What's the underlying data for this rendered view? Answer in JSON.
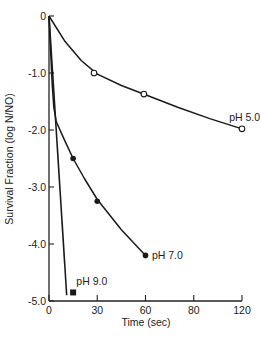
{
  "chart_data": {
    "type": "line",
    "title": "",
    "xlabel": "Time (sec)",
    "ylabel": "Survival Fraction (log N/NO)",
    "xlim": [
      0,
      120
    ],
    "ylim": [
      -5.0,
      0
    ],
    "grid": false,
    "x_ticks": [
      {
        "value": 0,
        "label": "0"
      },
      {
        "value": 30,
        "label": "30"
      },
      {
        "value": 60,
        "label": "60"
      },
      {
        "value": 90,
        "label": "80"
      },
      {
        "value": 120,
        "label": "120"
      }
    ],
    "y_ticks": [
      {
        "value": 0,
        "label": "0"
      },
      {
        "value": -1.0,
        "label": "-1.0"
      },
      {
        "value": -2.0,
        "label": "-2.0"
      },
      {
        "value": -3.0,
        "label": "-3.0"
      },
      {
        "value": -4.0,
        "label": "-4.0"
      },
      {
        "value": -5.0,
        "label": "-5.0"
      }
    ],
    "series": [
      {
        "name": "pH 5.0",
        "marker": "open-circle",
        "points": [
          [
            28,
            -1.0
          ],
          [
            59,
            -1.37
          ],
          [
            120,
            -1.98
          ]
        ],
        "curve": [
          [
            0,
            0
          ],
          [
            10,
            -0.45
          ],
          [
            20,
            -0.78
          ],
          [
            30,
            -1.02
          ],
          [
            45,
            -1.22
          ],
          [
            60,
            -1.38
          ],
          [
            80,
            -1.6
          ],
          [
            100,
            -1.8
          ],
          [
            120,
            -1.98
          ]
        ]
      },
      {
        "name": "pH 7.0",
        "marker": "filled-circle",
        "points": [
          [
            15,
            -2.5
          ],
          [
            30,
            -3.25
          ],
          [
            60,
            -4.2
          ]
        ],
        "curve": [
          [
            0,
            0
          ],
          [
            1,
            -0.6
          ],
          [
            2,
            -1.2
          ],
          [
            3,
            -1.6
          ],
          [
            4.5,
            -1.85
          ],
          [
            10,
            -2.2
          ],
          [
            15,
            -2.5
          ],
          [
            22,
            -2.85
          ],
          [
            30,
            -3.22
          ],
          [
            45,
            -3.75
          ],
          [
            60,
            -4.2
          ]
        ]
      },
      {
        "name": "pH 9.0",
        "marker": "filled-square",
        "points": [
          [
            15,
            -4.85
          ]
        ],
        "curve": [
          [
            0,
            0
          ],
          [
            11,
            -4.9
          ]
        ]
      }
    ],
    "annotations": [
      {
        "text": "pH 5.0",
        "x": 112,
        "y": -1.78
      },
      {
        "text": "pH 7.0",
        "x": 64,
        "y": -4.2
      },
      {
        "text": "pH 9.0",
        "x": 17,
        "y": -4.65
      }
    ]
  }
}
